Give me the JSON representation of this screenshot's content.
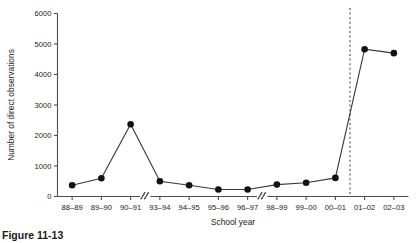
{
  "chart_data": {
    "type": "line",
    "title": "",
    "xlabel": "School year",
    "ylabel": "Number of direct observations",
    "categories": [
      "88–89",
      "89–90",
      "90–91",
      "93–94",
      "94–95",
      "95–96",
      "96–97",
      "98–99",
      "99–00",
      "00–01",
      "01–02",
      "02–03"
    ],
    "values": [
      370,
      600,
      2370,
      500,
      370,
      230,
      230,
      390,
      450,
      610,
      4830,
      4700
    ],
    "ylim": [
      0,
      6000
    ],
    "yticks": [
      0,
      1000,
      2000,
      3000,
      4000,
      5000,
      6000
    ],
    "ytick_labels": [
      "0",
      "1000",
      "2000",
      "3000",
      "4000",
      "5000",
      "6000"
    ],
    "grid": false,
    "legend": "none",
    "marker": "filled-circle",
    "axis_breaks": [
      {
        "after_category": "90–91",
        "note": "break between 90–91 and 93–94"
      },
      {
        "after_category": "96–97",
        "note": "break between 96–97 and 98–99"
      }
    ],
    "annotations": [
      {
        "type": "vertical-dashed-line",
        "between_categories": [
          "00–01",
          "01–02"
        ]
      }
    ],
    "series": [
      {
        "name": "Direct observations",
        "values": [
          370,
          600,
          2370,
          500,
          370,
          230,
          230,
          390,
          450,
          610,
          4830,
          4700
        ],
        "color": "#121212"
      }
    ]
  },
  "caption": {
    "text": "Figure 11-13"
  },
  "colors": {
    "axis": "#4d4d4d",
    "marker": "#121212",
    "line": "#3a3a3a",
    "reference_line": "#5a5a5a",
    "background": "#ffffff"
  }
}
